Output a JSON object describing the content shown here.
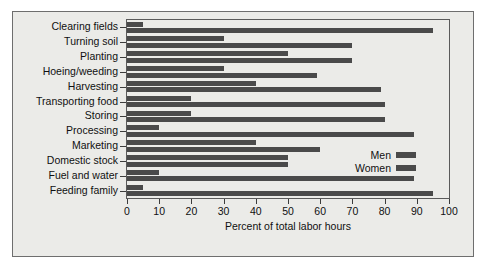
{
  "chart_data": {
    "type": "bar",
    "orientation": "horizontal",
    "title": "",
    "xlabel": "Percent of total labor hours",
    "ylabel": "",
    "xlim": [
      0,
      100
    ],
    "xticks": [
      0,
      10,
      20,
      30,
      40,
      50,
      60,
      70,
      80,
      90,
      100
    ],
    "grid": false,
    "legend_position": "center-right",
    "categories": [
      "Clearing fields",
      "Turning soil",
      "Planting",
      "Hoeing/weeding",
      "Harvesting",
      "Transporting food",
      "Storing",
      "Processing",
      "Marketing",
      "Domestic stock",
      "Fuel and water",
      "Feeding family"
    ],
    "series": [
      {
        "name": "Men",
        "color": "#4a4a4a",
        "values": [
          5,
          30,
          50,
          30,
          40,
          20,
          20,
          10,
          40,
          50,
          10,
          5
        ]
      },
      {
        "name": "Women",
        "color": "#4a4a4a",
        "values": [
          95,
          70,
          70,
          59,
          79,
          80,
          80,
          89,
          60,
          50,
          89,
          95
        ]
      }
    ]
  },
  "colors": {
    "bar": "#4a4a4a",
    "panel_background": "#ebebe8",
    "frame": "#5a5a5a",
    "text": "#101010"
  },
  "legend": {
    "items": [
      {
        "label": "Men"
      },
      {
        "label": "Women"
      }
    ]
  },
  "axis": {
    "x_title": "Percent of total labor hours",
    "tick_labels": [
      "0",
      "10",
      "20",
      "30",
      "40",
      "50",
      "60",
      "70",
      "80",
      "90",
      "100"
    ]
  }
}
